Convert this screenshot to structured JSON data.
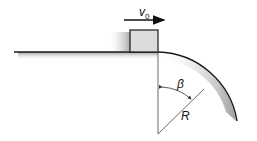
{
  "diagram": {
    "labels": {
      "velocity": "v",
      "velocity_sub": "0",
      "angle": "β",
      "radius": "R"
    },
    "colors": {
      "line": "#1a1a1a",
      "block_fill": "#dcdcdc",
      "shadow": "#9a9a9a",
      "thin_line": "#444444"
    }
  }
}
